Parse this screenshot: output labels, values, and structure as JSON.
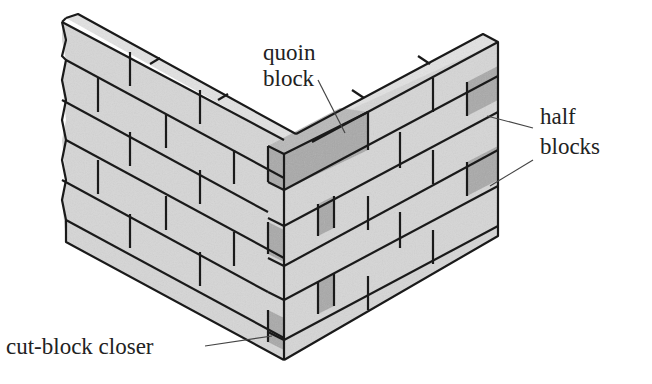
{
  "diagram": {
    "type": "masonry-wall-corner",
    "labels": {
      "quoin": [
        "quoin",
        "block"
      ],
      "half": [
        "half",
        "blocks"
      ],
      "closer": "cut-block closer"
    },
    "colors": {
      "block_face": "#d6d6d6",
      "block_top": "#e2e2e2",
      "special_block": "#a9a9a9",
      "outline": "#1a1a1a",
      "leader_line": "#444444",
      "text": "#222222"
    }
  }
}
